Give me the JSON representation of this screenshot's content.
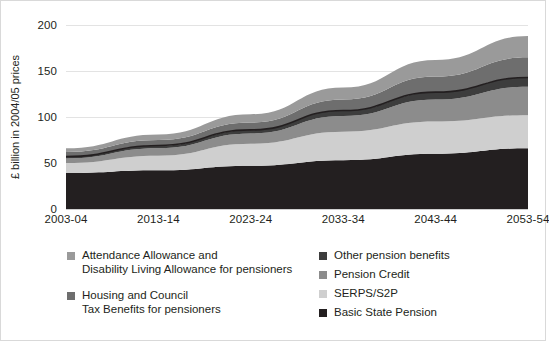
{
  "chart_data": {
    "type": "area",
    "title": "",
    "subtitle": "",
    "xlabel": "",
    "ylabel": "£ billion in 2004/05 prices",
    "stacked": true,
    "grid": true,
    "legend_position": "bottom",
    "xlim": [
      "2003-04",
      "2053-54"
    ],
    "ylim": [
      0,
      200
    ],
    "yticks": [
      0,
      50,
      100,
      150,
      200
    ],
    "ytick_labels": [
      "0",
      "50",
      "100",
      "150",
      "200"
    ],
    "x": [
      "2003-04",
      "2013-14",
      "2023-24",
      "2033-34",
      "2043-44",
      "2053-54"
    ],
    "xtick_labels": [
      "2003-04",
      "2013-14",
      "2023-24",
      "2033-34",
      "2043-44",
      "2053-54"
    ],
    "series": [
      {
        "name": "Basic State Pension",
        "color": "#231f20",
        "values": [
          39,
          42,
          47,
          53,
          60,
          66
        ]
      },
      {
        "name": "SERPS/S2P",
        "color": "#cfcfcf",
        "values": [
          11,
          16,
          24,
          31,
          35,
          36
        ]
      },
      {
        "name": "Pension Credit",
        "color": "#8c8c8c",
        "values": [
          5,
          8,
          11,
          17,
          24,
          31
        ]
      },
      {
        "name": "Other pension benefits",
        "color": "#3d3d3d",
        "values": [
          2,
          3,
          4,
          6,
          8,
          10
        ]
      },
      {
        "name": "Housing and Council Tax Benefits for pensioners",
        "color": "#6e6e6e",
        "values": [
          5,
          6,
          8,
          12,
          17,
          22
        ]
      },
      {
        "name": "Attendance Allowance and Disability Living Allowance for pensioners",
        "color": "#9a9a9a",
        "values": [
          4,
          6,
          9,
          13,
          18,
          23
        ]
      }
    ],
    "cumulative_tops": {
      "basic_state_pension": [
        39,
        42,
        47,
        53,
        60,
        66
      ],
      "serps_s2p": [
        50,
        58,
        71,
        84,
        95,
        102
      ],
      "pension_credit": [
        55,
        66,
        82,
        101,
        119,
        133
      ],
      "other_pension_benefits": [
        57,
        69,
        86,
        107,
        127,
        143
      ],
      "housing_council_tax": [
        62,
        75,
        94,
        119,
        144,
        165
      ],
      "attendance_allowance_dla": [
        66,
        81,
        103,
        132,
        162,
        188
      ]
    }
  },
  "axes": {
    "y_title": "£ billion in 2004/05 prices",
    "y_ticks": [
      {
        "label": "200",
        "value": 200
      },
      {
        "label": "150",
        "value": 150
      },
      {
        "label": "100",
        "value": 100
      },
      {
        "label": "50",
        "value": 50
      },
      {
        "label": "0",
        "value": 0
      }
    ],
    "x_ticks": [
      {
        "label": "2003-04",
        "value": 0
      },
      {
        "label": "2013-14",
        "value": 1
      },
      {
        "label": "2023-24",
        "value": 2
      },
      {
        "label": "2033-34",
        "value": 3
      },
      {
        "label": "2043-44",
        "value": 4
      },
      {
        "label": "2053-54",
        "value": 5
      }
    ]
  },
  "legend": {
    "left_column": [
      {
        "label": "Attendance Allowance and\nDisability Living Allowance for pensioners",
        "color": "#9a9a9a"
      },
      {
        "label": "Housing and Council\nTax Benefits for pensioners",
        "color": "#6e6e6e"
      }
    ],
    "right_column": [
      {
        "label": "Other pension benefits",
        "color": "#3d3d3d"
      },
      {
        "label": "Pension Credit",
        "color": "#8c8c8c"
      },
      {
        "label": "SERPS/S2P",
        "color": "#cfcfcf"
      },
      {
        "label": "Basic State Pension",
        "color": "#231f20"
      }
    ]
  },
  "colors": {
    "background": "#ffffff",
    "text": "#231f20",
    "gridline": "#e3e3e3",
    "axis": "#cfcfcf",
    "border": "#d9d9d9",
    "separator_line": "#231f20"
  }
}
